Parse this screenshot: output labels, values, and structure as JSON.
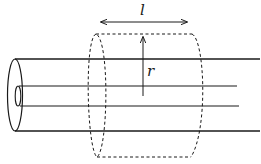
{
  "diagram": {
    "title": "",
    "labels": {
      "length": "l",
      "radius": "r"
    },
    "components": [
      "outer-conductor",
      "inner-conductor",
      "gaussian-cylinder-dashed",
      "length-arrow",
      "radius-arrow"
    ],
    "colors": {
      "stroke": "#1a1a1a",
      "background": "#ffffff"
    }
  }
}
